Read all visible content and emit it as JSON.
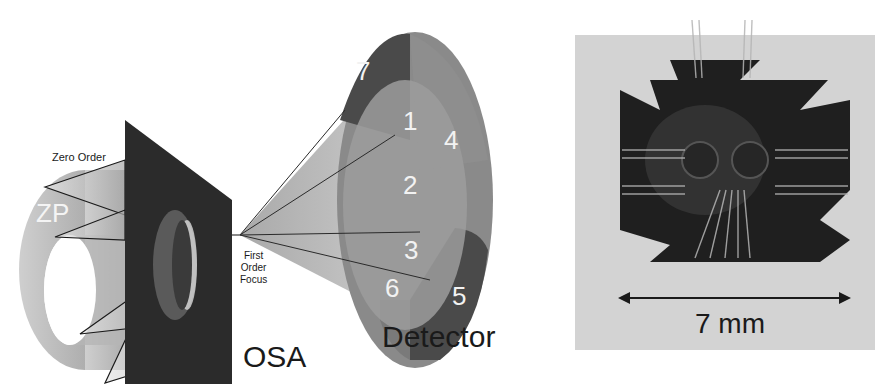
{
  "figure": {
    "left_panel": {
      "labels": {
        "zero_order": "Zero Order",
        "zone_plate": "ZP",
        "first_order_focus": [
          "First",
          "Order",
          "Focus"
        ],
        "osa": "OSA",
        "detector": "Detector"
      },
      "detector_segments": [
        "1",
        "2",
        "3",
        "4",
        "5",
        "6",
        "7"
      ]
    },
    "right_panel": {
      "scale_bar_label": "7 mm"
    },
    "colors": {
      "osa_plate": "#2b2b2b",
      "zp_ring": "#bdbdbd",
      "detector_dark": "#4a4a4a",
      "detector_mid": "#8a8a8a",
      "sample_dark": "#1f1f1f",
      "background_photo": "#d6d6d6"
    }
  }
}
